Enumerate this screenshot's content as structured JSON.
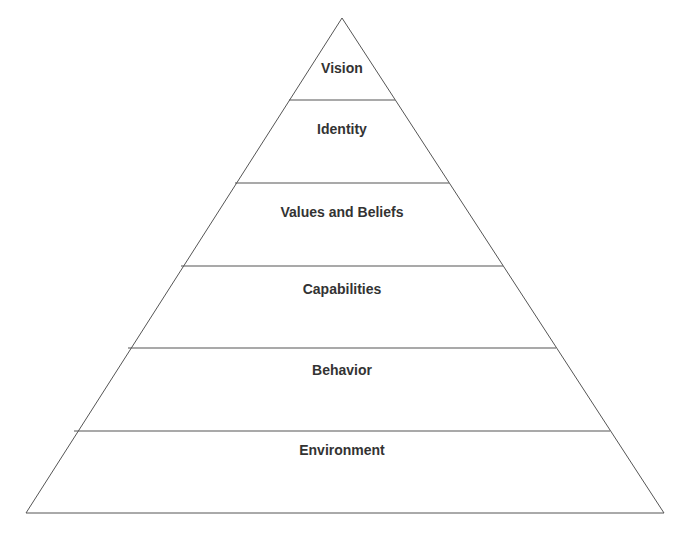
{
  "diagram": {
    "levels": [
      {
        "label": "Vision"
      },
      {
        "label": "Identity"
      },
      {
        "label": "Values and Beliefs"
      },
      {
        "label": "Capabilities"
      },
      {
        "label": "Behavior"
      },
      {
        "label": "Environment"
      }
    ],
    "colors": {
      "line": "#555555",
      "text": "#333333",
      "background": "#ffffff"
    }
  }
}
